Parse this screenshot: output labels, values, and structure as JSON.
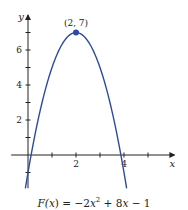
{
  "chart_data": {
    "type": "line",
    "title": "",
    "caption": {
      "prefix": "F(",
      "var": "x",
      "mid": ") = −2",
      "var2": "x",
      "sup": "2",
      "mid2": " + 8",
      "var3": "x",
      "suffix": " − 1"
    },
    "function": "F(x) = -2x^2 + 8x - 1",
    "coefficients": {
      "a": -2,
      "b": 8,
      "c": -1
    },
    "x_domain": [
      -0.11,
      4.11
    ],
    "xlabel": "x",
    "ylabel": "y",
    "xlim": [
      -0.7,
      6.1
    ],
    "ylim": [
      -1.9,
      8.0
    ],
    "x_ticks": [
      1,
      2,
      3,
      4,
      5
    ],
    "x_tick_labels": [
      {
        "value": 2,
        "label": "2"
      },
      {
        "value": 4,
        "label": "4"
      }
    ],
    "y_ticks": [
      -1,
      1,
      2,
      3,
      4,
      5,
      6,
      7
    ],
    "y_tick_labels": [
      {
        "value": 2,
        "label": "2"
      },
      {
        "value": 4,
        "label": "4"
      },
      {
        "value": 6,
        "label": "6"
      }
    ],
    "highlighted_points": [
      {
        "x": 2,
        "y": 7,
        "label": "(2, 7)"
      }
    ],
    "grid": false,
    "colors": {
      "curve": "#2e4a9c",
      "axis": "#222222"
    }
  }
}
